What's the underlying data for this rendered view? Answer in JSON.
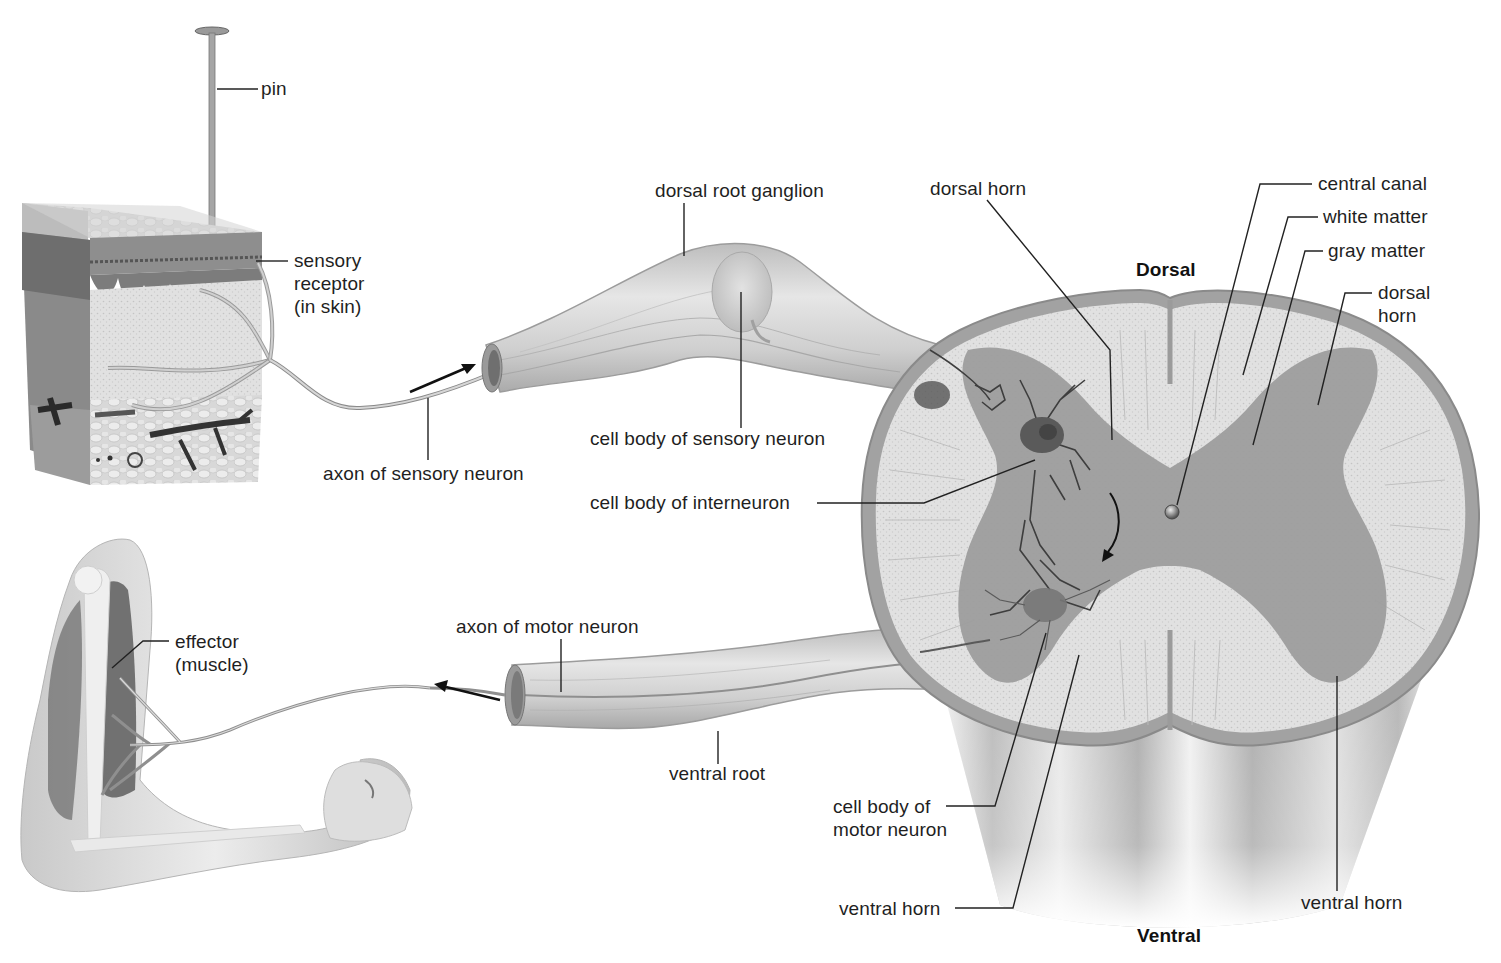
{
  "figure": {
    "type": "reflex-arc-anatomy-diagram",
    "orientation_labels": {
      "dorsal": "Dorsal",
      "ventral": "Ventral"
    },
    "labels": {
      "pin": "pin",
      "sensory_receptor": "sensory\nreceptor\n(in skin)",
      "axon_sensory": "axon of sensory neuron",
      "dorsal_root_ganglion": "dorsal root ganglion",
      "cell_body_sensory": "cell body of sensory neuron",
      "cell_body_interneuron": "cell body of interneuron",
      "dorsal_horn_left": "dorsal horn",
      "central_canal": "central canal",
      "white_matter": "white matter",
      "gray_matter": "gray matter",
      "dorsal_horn_right": "dorsal\nhorn",
      "effector": "effector\n(muscle)",
      "axon_motor": "axon of motor neuron",
      "ventral_root": "ventral root",
      "cell_body_motor": "cell body of\nmotor neuron",
      "ventral_horn_left": "ventral horn",
      "ventral_horn_right": "ventral horn"
    },
    "signal_arrows": [
      {
        "id": "afferent",
        "direction": "toward spinal cord"
      },
      {
        "id": "efferent",
        "direction": "toward muscle"
      },
      {
        "id": "interneuron-to-motor",
        "direction": "curved, downward"
      }
    ],
    "colors": {
      "background": "#ffffff",
      "text": "#1f1f1f",
      "gray_matter": "#9a9a9a",
      "white_matter": "#dcdcdc",
      "cord_outline": "#8c8c8c",
      "nerve": "#c8c8c8"
    }
  }
}
